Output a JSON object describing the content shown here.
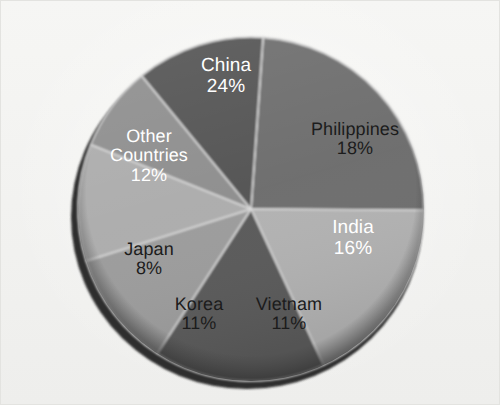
{
  "chart_data": {
    "type": "pie",
    "title": "",
    "subtitle": "",
    "xlabel": "",
    "ylabel": "",
    "legend_position": "none",
    "grid": false,
    "labels_inside_slices": true,
    "value_suffix": "%",
    "total": 100,
    "categories": [
      "China",
      "Philippines",
      "India",
      "Vietnam",
      "Korea",
      "Japan",
      "Other Countries"
    ],
    "values": [
      24,
      18,
      16,
      11,
      11,
      8,
      12
    ],
    "slices": [
      {
        "name": "China",
        "label": "China",
        "value": 24,
        "value_text": "24%",
        "color": "#6e6e6e",
        "text_color": "#ffffff",
        "start_angle": 4,
        "end_angle": 90.4,
        "label_x": 225,
        "label_y": 76,
        "label_size": 19,
        "label_lines": [
          "China",
          "24%"
        ]
      },
      {
        "name": "Philippines",
        "label": "Philippines",
        "value": 18,
        "value_text": "18%",
        "color": "#b2b2b2",
        "text_color": "#1c1c1c",
        "start_angle": 90.4,
        "end_angle": 155.2,
        "label_x": 354,
        "label_y": 138,
        "label_size": 18,
        "label_lines": [
          "Philippines",
          "18%"
        ]
      },
      {
        "name": "India",
        "label": "India",
        "value": 16,
        "value_text": "16%",
        "color": "#5a5a5a",
        "text_color": "#ffffff",
        "start_angle": 155.2,
        "end_angle": 212.8,
        "label_x": 352,
        "label_y": 238,
        "label_size": 19,
        "label_lines": [
          "India",
          "16%"
        ]
      },
      {
        "name": "Vietnam",
        "label": "Vietnam",
        "value": 11,
        "value_text": "11%",
        "color": "#9c9c9c",
        "text_color": "#1c1c1c",
        "start_angle": 212.8,
        "end_angle": 252.4,
        "label_x": 288,
        "label_y": 313,
        "label_size": 18,
        "label_lines": [
          "Vietnam",
          "11%"
        ]
      },
      {
        "name": "Korea",
        "label": "Korea",
        "value": 11,
        "value_text": "11%",
        "color": "#adadad",
        "text_color": "#1c1c1c",
        "start_angle": 252.4,
        "end_angle": 292,
        "label_x": 198,
        "label_y": 313,
        "label_size": 18,
        "label_lines": [
          "Korea",
          "11%"
        ]
      },
      {
        "name": "Japan",
        "label": "Japan",
        "value": 8,
        "value_text": "8%",
        "color": "#8f8f8f",
        "text_color": "#1c1c1c",
        "start_angle": 292,
        "end_angle": 320.8,
        "label_x": 148,
        "label_y": 258,
        "label_size": 18,
        "label_lines": [
          "Japan",
          "8%"
        ]
      },
      {
        "name": "Other Countries",
        "label": "Other Countries",
        "value": 12,
        "value_text": "12%",
        "color": "#545454",
        "text_color": "#ffffff",
        "start_angle": 320.8,
        "end_angle": 364,
        "label_x": 148,
        "label_y": 155,
        "label_size": 18,
        "label_lines": [
          "Other",
          "Countries",
          "12%"
        ]
      }
    ],
    "geometry": {
      "center_x": 250,
      "center_y": 208,
      "radius_x": 173,
      "radius_y": 172,
      "rim_color": "#3a3a3a",
      "separator_color": "#d8d8d8",
      "background": "#f2f2f0"
    }
  }
}
